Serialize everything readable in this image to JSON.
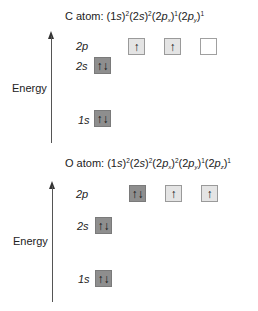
{
  "diagrams": [
    {
      "atom": "C",
      "title_prefix": "C atom:",
      "configuration": [
        {
          "orbital": "1s",
          "sub": "",
          "occ": "2"
        },
        {
          "orbital": "2s",
          "sub": "",
          "occ": "2"
        },
        {
          "orbital": "2p",
          "sub": "x",
          "occ": "1"
        },
        {
          "orbital": "2p",
          "sub": "y",
          "occ": "1"
        }
      ],
      "axis_label": "Energy",
      "levels": {
        "2p": {
          "label": "2p",
          "orbitals": [
            {
              "state": "half",
              "spins": "↑"
            },
            {
              "state": "half",
              "spins": "↑"
            },
            {
              "state": "empty",
              "spins": ""
            }
          ]
        },
        "2s": {
          "label": "2s",
          "orbitals": [
            {
              "state": "full",
              "spins": "↑↓"
            }
          ]
        },
        "1s": {
          "label": "1s",
          "orbitals": [
            {
              "state": "full",
              "spins": "↑↓"
            }
          ]
        }
      }
    },
    {
      "atom": "O",
      "title_prefix": "O atom:",
      "configuration": [
        {
          "orbital": "1s",
          "sub": "",
          "occ": "2"
        },
        {
          "orbital": "2s",
          "sub": "",
          "occ": "2"
        },
        {
          "orbital": "2p",
          "sub": "x",
          "occ": "2"
        },
        {
          "orbital": "2p",
          "sub": "y",
          "occ": "1"
        },
        {
          "orbital": "2p",
          "sub": "z",
          "occ": "1"
        }
      ],
      "axis_label": "Energy",
      "levels": {
        "2p": {
          "label": "2p",
          "orbitals": [
            {
              "state": "full",
              "spins": "↑↓"
            },
            {
              "state": "half",
              "spins": "↑"
            },
            {
              "state": "half",
              "spins": "↑"
            }
          ]
        },
        "2s": {
          "label": "2s",
          "orbitals": [
            {
              "state": "full",
              "spins": "↑↓"
            }
          ]
        },
        "1s": {
          "label": "1s",
          "orbitals": [
            {
              "state": "full",
              "spins": "↑↓"
            }
          ]
        }
      }
    }
  ]
}
